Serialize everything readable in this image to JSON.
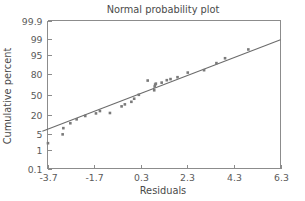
{
  "chart_data": {
    "type": "scatter",
    "title": "Normal probability plot",
    "xlabel": "Residuals",
    "ylabel": "Cumulative percent",
    "grid": false,
    "legend": null,
    "yscale": "normal-probability",
    "xlim": [
      -3.7,
      6.3
    ],
    "ylim": [
      0.1,
      99.9
    ],
    "xticks": [
      -3.7,
      -1.7,
      0.3,
      2.3,
      4.3,
      6.3
    ],
    "xticklabels": [
      "-3.7",
      "-1.7",
      "0.3",
      "2.3",
      "4.3",
      "6.3"
    ],
    "yticks": [
      0.1,
      1,
      5,
      20,
      50,
      80,
      95,
      99,
      99.9
    ],
    "yticklabels": [
      "0.1",
      "1",
      "5",
      "20",
      "50",
      "80",
      "95",
      "99",
      "99.9"
    ],
    "series": [
      {
        "name": "residuals",
        "marker": "filled-square",
        "color": "#7a7a7a",
        "points": [
          {
            "x": -3.68,
            "y": 2.1
          },
          {
            "x": -3.05,
            "y": 4.8
          },
          {
            "x": -3.02,
            "y": 8.0
          },
          {
            "x": -2.72,
            "y": 11.5
          },
          {
            "x": -2.45,
            "y": 15.0
          },
          {
            "x": -2.08,
            "y": 18.5
          },
          {
            "x": -1.62,
            "y": 21.5
          },
          {
            "x": -1.45,
            "y": 24.5
          },
          {
            "x": -1.02,
            "y": 22.0
          },
          {
            "x": -0.52,
            "y": 31.0
          },
          {
            "x": -0.38,
            "y": 34.0
          },
          {
            "x": -0.1,
            "y": 38.0
          },
          {
            "x": 0.02,
            "y": 43.0
          },
          {
            "x": 0.22,
            "y": 49.5
          },
          {
            "x": 0.6,
            "y": 72.0
          },
          {
            "x": 0.88,
            "y": 57.0
          },
          {
            "x": 0.9,
            "y": 63.0
          },
          {
            "x": 0.92,
            "y": 66.0
          },
          {
            "x": 0.95,
            "y": 67.5
          },
          {
            "x": 1.2,
            "y": 69.0
          },
          {
            "x": 1.42,
            "y": 72.5
          },
          {
            "x": 1.58,
            "y": 74.0
          },
          {
            "x": 1.88,
            "y": 76.5
          },
          {
            "x": 2.32,
            "y": 82.0
          },
          {
            "x": 3.02,
            "y": 84.5
          },
          {
            "x": 3.55,
            "y": 90.5
          },
          {
            "x": 3.92,
            "y": 93.5
          },
          {
            "x": 4.92,
            "y": 97.0
          }
        ]
      }
    ],
    "fit_line": {
      "name": "reference-line",
      "color": "#6b6b6b",
      "x_start": -3.92,
      "y_start": 6.2,
      "x_end": 6.3,
      "y_end": 98.9
    }
  }
}
